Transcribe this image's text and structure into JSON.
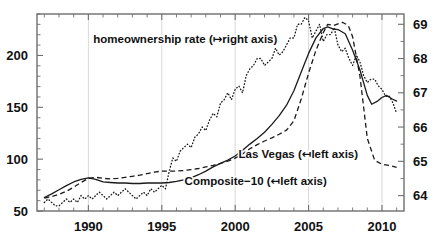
{
  "chart_data": {
    "type": "line",
    "title": "",
    "subtitle": "",
    "xlabel": "",
    "ylabel": "",
    "y2label": "",
    "grid": true,
    "legend_position": "inline-annotations",
    "xlim": [
      1986.5,
      2011.5
    ],
    "ylim": [
      50,
      240
    ],
    "y2lim": [
      63.55,
      69.3
    ],
    "xticks": [
      1990,
      1995,
      2000,
      2005,
      2010
    ],
    "xticklabels": [
      "1990",
      "1995",
      "2000",
      "2005",
      "2010"
    ],
    "xminor_step": 1,
    "yticks": [
      50,
      100,
      150,
      200
    ],
    "yticklabels": [
      "50",
      "100",
      "150",
      "200"
    ],
    "yminor_step": 10,
    "y2ticks": [
      64,
      65,
      66,
      67,
      68,
      69
    ],
    "y2ticklabels": [
      "64",
      "65",
      "66",
      "67",
      "68",
      "69"
    ],
    "gridlines_x": [
      1990,
      1995,
      2000,
      2005,
      2010
    ],
    "annotations": [
      {
        "id": "homeownership-label",
        "text": "homeownership rate (↦right axis)",
        "x": 1996.6,
        "y": 212,
        "anchor": "middle"
      },
      {
        "id": "las-vegas-label",
        "text": "Las Vegas (↤left axis)",
        "x": 2004.3,
        "y": 101,
        "anchor": "middle"
      },
      {
        "id": "composite-label",
        "text": "Composite−10 (↤left axis)",
        "x": 2001.4,
        "y": 75,
        "anchor": "middle"
      }
    ],
    "series": [
      {
        "name": "Composite-10",
        "axis": "left",
        "style": "solid",
        "x": [
          1987.0,
          1987.5,
          1988.0,
          1988.5,
          1989.0,
          1989.5,
          1990.0,
          1990.5,
          1991.0,
          1991.5,
          1992.0,
          1992.5,
          1993.0,
          1993.5,
          1994.0,
          1994.5,
          1995.0,
          1995.5,
          1996.0,
          1996.5,
          1997.0,
          1997.5,
          1998.0,
          1998.5,
          1999.0,
          1999.5,
          2000.0,
          2000.5,
          2001.0,
          2001.5,
          2002.0,
          2002.5,
          2003.0,
          2003.5,
          2004.0,
          2004.5,
          2005.0,
          2005.5,
          2006.0,
          2006.3,
          2006.7,
          2007.0,
          2007.5,
          2008.0,
          2008.5,
          2009.0,
          2009.3,
          2009.7,
          2010.0,
          2010.3,
          2010.7,
          2011.0
        ],
        "y": [
          63.0,
          66.5,
          70.5,
          74.5,
          78.0,
          80.5,
          82.0,
          80.5,
          78.0,
          77.5,
          77.0,
          77.0,
          76.5,
          76.5,
          77.0,
          77.0,
          77.0,
          77.5,
          78.5,
          80.0,
          82.0,
          85.0,
          88.5,
          92.5,
          96.0,
          99.0,
          103.0,
          108.5,
          114.5,
          120.0,
          126.0,
          133.5,
          142.0,
          152.0,
          166.0,
          184.0,
          202.0,
          217.0,
          226.0,
          227.5,
          225.5,
          225.0,
          221.0,
          205.0,
          186.0,
          161.5,
          153.0,
          156.0,
          159.5,
          161.5,
          158.0,
          156.0
        ]
      },
      {
        "name": "Las Vegas",
        "axis": "left",
        "style": "dashed",
        "x": [
          1987.0,
          1987.5,
          1988.0,
          1988.5,
          1989.0,
          1989.5,
          1990.0,
          1990.5,
          1991.0,
          1991.5,
          1992.0,
          1992.5,
          1993.0,
          1993.5,
          1994.0,
          1994.5,
          1995.0,
          1995.5,
          1996.0,
          1996.5,
          1997.0,
          1997.5,
          1998.0,
          1998.5,
          1999.0,
          1999.5,
          2000.0,
          2000.5,
          2001.0,
          2001.5,
          2002.0,
          2002.5,
          2003.0,
          2003.5,
          2004.0,
          2004.5,
          2005.0,
          2005.5,
          2006.0,
          2006.3,
          2006.7,
          2007.0,
          2007.3,
          2007.7,
          2008.0,
          2008.5,
          2009.0,
          2009.5,
          2010.0,
          2010.5,
          2011.0
        ],
        "y": [
          62.5,
          64.0,
          66.0,
          69.0,
          73.0,
          77.5,
          81.5,
          82.5,
          81.5,
          81.0,
          81.5,
          82.5,
          83.5,
          84.5,
          86.0,
          87.5,
          88.5,
          88.5,
          88.5,
          89.0,
          90.0,
          91.0,
          92.5,
          94.0,
          96.0,
          98.0,
          101.0,
          105.0,
          110.0,
          114.0,
          117.5,
          120.5,
          124.0,
          128.0,
          137.0,
          158.0,
          183.0,
          205.0,
          222.0,
          230.0,
          229.0,
          230.5,
          232.0,
          229.0,
          218.0,
          180.0,
          120.0,
          99.0,
          95.0,
          94.0,
          92.0
        ]
      },
      {
        "name": "homeownership rate",
        "axis": "right",
        "style": "dotted",
        "x": [
          1987.0,
          1987.25,
          1987.5,
          1987.75,
          1988.0,
          1988.25,
          1988.5,
          1988.75,
          1989.0,
          1989.25,
          1989.5,
          1989.75,
          1990.0,
          1990.25,
          1990.5,
          1990.75,
          1991.0,
          1991.25,
          1991.5,
          1991.75,
          1992.0,
          1992.25,
          1992.5,
          1992.75,
          1993.0,
          1993.25,
          1993.5,
          1993.75,
          1994.0,
          1994.25,
          1994.5,
          1994.75,
          1995.0,
          1995.25,
          1995.5,
          1995.75,
          1996.0,
          1996.25,
          1996.5,
          1996.75,
          1997.0,
          1997.25,
          1997.5,
          1997.75,
          1998.0,
          1998.25,
          1998.5,
          1998.75,
          1999.0,
          1999.25,
          1999.5,
          1999.75,
          2000.0,
          2000.25,
          2000.5,
          2000.75,
          2001.0,
          2001.25,
          2001.5,
          2001.75,
          2002.0,
          2002.25,
          2002.5,
          2002.75,
          2003.0,
          2003.25,
          2003.5,
          2003.75,
          2004.0,
          2004.25,
          2004.5,
          2004.75,
          2005.0,
          2005.25,
          2005.5,
          2005.75,
          2006.0,
          2006.25,
          2006.5,
          2006.75,
          2007.0,
          2007.25,
          2007.5,
          2007.75,
          2008.0,
          2008.25,
          2008.5,
          2008.75,
          2009.0,
          2009.25,
          2009.5,
          2009.75,
          2010.0,
          2010.25,
          2010.5,
          2010.75,
          2011.0
        ],
        "y": [
          63.8,
          63.9,
          63.8,
          63.7,
          63.7,
          63.8,
          63.9,
          63.8,
          63.9,
          63.8,
          64.0,
          63.9,
          64.0,
          63.9,
          64.0,
          64.1,
          64.0,
          63.9,
          64.0,
          64.1,
          64.0,
          64.1,
          64.2,
          64.1,
          64.0,
          63.9,
          64.0,
          64.1,
          64.0,
          64.2,
          64.1,
          64.2,
          64.3,
          64.2,
          64.7,
          65.1,
          65.0,
          65.3,
          65.4,
          65.5,
          65.4,
          65.7,
          65.8,
          66.0,
          65.9,
          66.2,
          66.4,
          66.3,
          66.7,
          66.8,
          67.0,
          66.8,
          67.1,
          67.2,
          67.0,
          67.5,
          67.7,
          67.8,
          68.0,
          68.0,
          67.8,
          67.9,
          68.0,
          68.3,
          68.1,
          68.2,
          68.4,
          68.6,
          68.6,
          69.0,
          69.0,
          69.2,
          69.1,
          68.6,
          68.8,
          69.0,
          68.5,
          68.7,
          68.7,
          68.9,
          68.4,
          68.2,
          68.3,
          68.0,
          67.8,
          68.1,
          67.9,
          67.5,
          67.3,
          67.4,
          67.4,
          67.2,
          67.1,
          66.9,
          66.9,
          66.7,
          66.4
        ]
      }
    ]
  },
  "layout": {
    "plot_left": 37,
    "plot_right": 404,
    "plot_top": 14,
    "plot_bottom": 211,
    "width": 440,
    "height": 239
  }
}
